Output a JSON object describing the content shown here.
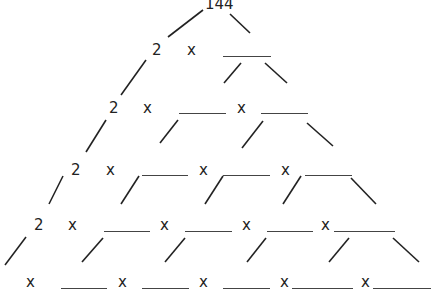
{
  "root": {
    "value": "144",
    "x": 205,
    "y": -4
  },
  "multiply_sign": "x",
  "factor": "2",
  "rows": [
    {
      "items": [
        {
          "type": "factor",
          "text": "2",
          "x": 152,
          "y": 42
        },
        {
          "type": "times",
          "x": 187,
          "y": 42
        },
        {
          "type": "blank",
          "x1": 223,
          "x2": 271,
          "y": 56
        }
      ]
    },
    {
      "items": [
        {
          "type": "factor",
          "text": "2",
          "x": 109,
          "y": 100
        },
        {
          "type": "times",
          "x": 143,
          "y": 100
        },
        {
          "type": "blank",
          "x1": 179,
          "x2": 226,
          "y": 113
        },
        {
          "type": "times",
          "x": 237,
          "y": 100
        },
        {
          "type": "blank",
          "x1": 261,
          "x2": 308,
          "y": 113
        }
      ]
    },
    {
      "items": [
        {
          "type": "factor",
          "text": "2",
          "x": 71,
          "y": 162
        },
        {
          "type": "times",
          "x": 106,
          "y": 162
        },
        {
          "type": "blank",
          "x1": 142,
          "x2": 188,
          "y": 175
        },
        {
          "type": "times",
          "x": 199,
          "y": 162
        },
        {
          "type": "blank",
          "x1": 223,
          "x2": 270,
          "y": 175
        },
        {
          "type": "times",
          "x": 281,
          "y": 162
        },
        {
          "type": "blank",
          "x1": 305,
          "x2": 352,
          "y": 175
        }
      ]
    },
    {
      "items": [
        {
          "type": "factor",
          "text": "2",
          "x": 34,
          "y": 217
        },
        {
          "type": "times",
          "x": 68,
          "y": 217
        },
        {
          "type": "blank",
          "x1": 104,
          "x2": 150,
          "y": 231
        },
        {
          "type": "times",
          "x": 160,
          "y": 217
        },
        {
          "type": "blank",
          "x1": 185,
          "x2": 232,
          "y": 231
        },
        {
          "type": "times",
          "x": 242,
          "y": 217
        },
        {
          "type": "blank",
          "x1": 267,
          "x2": 313,
          "y": 231
        },
        {
          "type": "times",
          "x": 321,
          "y": 217
        },
        {
          "type": "blank",
          "x1": 334,
          "x2": 395,
          "y": 231
        }
      ]
    },
    {
      "items": [
        {
          "type": "times",
          "x": 26,
          "y": 274
        },
        {
          "type": "blank",
          "x1": 61,
          "x2": 107,
          "y": 288
        },
        {
          "type": "times",
          "x": 118,
          "y": 274
        },
        {
          "type": "blank",
          "x1": 142,
          "x2": 189,
          "y": 288
        },
        {
          "type": "times",
          "x": 199,
          "y": 274
        },
        {
          "type": "blank",
          "x1": 223,
          "x2": 270,
          "y": 288
        },
        {
          "type": "times",
          "x": 280,
          "y": 274
        },
        {
          "type": "blank",
          "x1": 292,
          "x2": 353,
          "y": 288
        },
        {
          "type": "times",
          "x": 361,
          "y": 274
        },
        {
          "type": "blank",
          "x1": 373,
          "x2": 431,
          "y": 288
        }
      ]
    }
  ],
  "branches": [
    [
      203,
      10,
      168,
      37
    ],
    [
      230,
      14,
      250,
      33
    ],
    [
      146,
      60,
      121,
      95
    ],
    [
      241,
      63,
      224,
      83
    ],
    [
      265,
      63,
      287,
      83
    ],
    [
      106,
      120,
      86,
      152
    ],
    [
      178,
      120,
      160,
      143
    ],
    [
      263,
      121,
      242,
      148
    ],
    [
      307,
      123,
      333,
      146
    ],
    [
      63,
      176,
      49,
      204
    ],
    [
      139,
      176,
      121,
      204
    ],
    [
      223,
      176,
      205,
      204
    ],
    [
      301,
      176,
      283,
      204
    ],
    [
      351,
      178,
      376,
      204
    ],
    [
      26,
      237,
      5,
      265
    ],
    [
      103,
      238,
      82,
      262
    ],
    [
      185,
      238,
      165,
      262
    ],
    [
      266,
      238,
      247,
      262
    ],
    [
      349,
      238,
      329,
      262
    ],
    [
      393,
      238,
      419,
      262
    ]
  ],
  "colors": {
    "text": "#222222",
    "line": "#222222",
    "blank": "#444444",
    "background": "#ffffff"
  }
}
